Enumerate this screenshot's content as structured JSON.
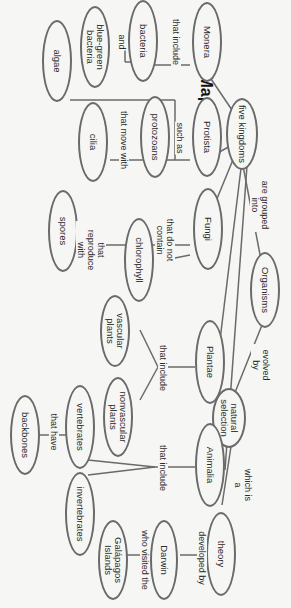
{
  "title": "Concept Map",
  "nodes": {
    "organisms": "Organisms",
    "five_kingdoms": "five kingdoms",
    "monera": "Monera",
    "protista": "Protista",
    "fungi": "Fungi",
    "plantae": "Plantae",
    "animalia": "Animalia",
    "natural_selection": "natural selection",
    "theory": "theory",
    "darwin": "Darwin",
    "galapagos": "Galápagos Islands",
    "bacteria": "bacteria",
    "blue_green_bacteria": "blue-green bacteria",
    "algae": "algae",
    "protozoans": "protozoans",
    "cilia": "cilia",
    "spores": "spores",
    "chlorophyll": "chlorophyll",
    "vascular_plants": "vascular plants",
    "nonvascular_plants": "nonvascular plants",
    "vertebrates": "vertebrates",
    "invertebrates": "invertebrates",
    "backbones": "backbones"
  },
  "links": {
    "are_grouped_into": "are grouped into",
    "evolved_by": "evolved by",
    "which_is_a": "which is a",
    "developed_by": "developed by",
    "who_visited_the": "who visited the",
    "monera_that_include": "that include",
    "and": "and",
    "such_as": "such as",
    "that_move_with": "that move with",
    "that_reproduce_with": "that reproduce with",
    "that_do_not_contain": "that do not contain",
    "plantae_that_include": "that include",
    "animalia_that_include": "that include",
    "that_have": "that have"
  },
  "colors": {
    "line": "#6a6a6a",
    "background": "#f6f6f4",
    "text": "#2a2a2a"
  }
}
